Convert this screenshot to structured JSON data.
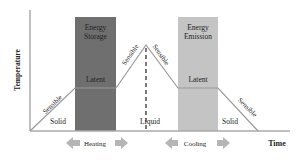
{
  "diagram": {
    "y_axis_label": "Temperature",
    "x_axis_label": "Time",
    "boxes": [
      {
        "label_line1": "Energy",
        "label_line2": "Storage",
        "color": "#6f6f6f"
      },
      {
        "label_line1": "Energy",
        "label_line2": "Emission",
        "color": "#c4c4c4"
      }
    ],
    "segment_labels": {
      "sensible_rise_1": "Sensible",
      "latent_1": "Latent",
      "sensible_rise_2": "Sensible",
      "sensible_fall_1": "Sensible",
      "latent_2": "Latent",
      "sensible_fall_2": "Sensible"
    },
    "phase_labels": {
      "solid_left": "Solid",
      "liquid": "Liquid",
      "solid_right": "Solid"
    },
    "process_labels": {
      "heating": "Heating",
      "cooling": "Cooling"
    },
    "colors": {
      "axis": "#aaaaaa",
      "curve": "#9a9a9a",
      "arrow": "#b5b5b5",
      "dashed": "#333333"
    }
  }
}
